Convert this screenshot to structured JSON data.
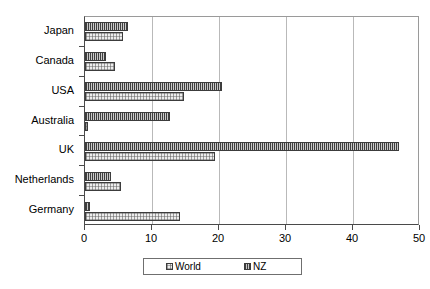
{
  "chart_data": {
    "type": "bar",
    "orientation": "horizontal",
    "title": "",
    "xlabel": "",
    "ylabel": "",
    "xlim": [
      0,
      50
    ],
    "xticks": [
      0,
      10,
      20,
      30,
      40,
      50
    ],
    "xtick_labels": [
      "0",
      "10",
      "20",
      "30",
      "40",
      "50"
    ],
    "grid": true,
    "grid_axis": "x",
    "legend_position": "bottom",
    "categories": [
      "Japan",
      "Canada",
      "USA",
      "Australia",
      "UK",
      "Netherlands",
      "Germany"
    ],
    "series": [
      {
        "name": "World",
        "color": "#ededed",
        "pattern": "light-dotted",
        "values": [
          5.7,
          4.5,
          14.8,
          0.4,
          19.4,
          5.4,
          14.2
        ]
      },
      {
        "name": "NZ",
        "color": "#8e8e8e",
        "pattern": "dense-vertical-hatch",
        "values": [
          6.4,
          3.1,
          20.5,
          12.7,
          46.8,
          3.9,
          0.8
        ]
      }
    ]
  },
  "legend": {
    "items": [
      {
        "label": "World",
        "swatch": "world-swatch"
      },
      {
        "label": "NZ",
        "swatch": "nz-swatch"
      }
    ]
  },
  "colors": {
    "plot_background": "#ffffff",
    "axis_line": "#4a4a4a",
    "gridline": "#b9b9b9",
    "bar_border": "#3c3c3c",
    "world_fill": "#ededed",
    "nz_fill": "#8e8e8e"
  }
}
